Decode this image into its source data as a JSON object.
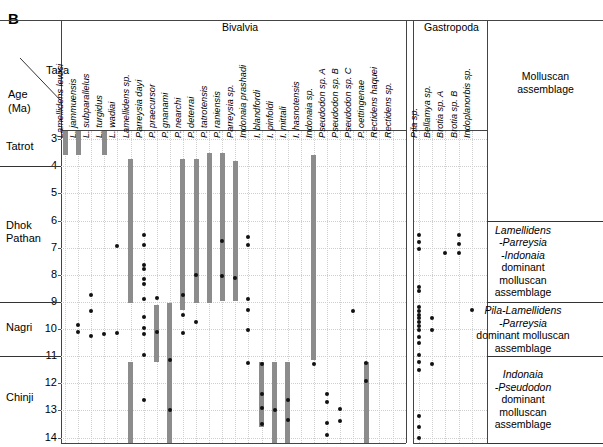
{
  "figure": {
    "panel_letter": "B",
    "axis_labels": {
      "taxa": "Taxa",
      "age_line1": "Age",
      "age_line2": "(Ma)"
    },
    "groups": [
      {
        "name": "bivalvia",
        "label": "Bivalvia"
      },
      {
        "name": "gastropoda",
        "label": "Gastropoda"
      },
      {
        "name": "assemblage",
        "label_line1": "Molluscan",
        "label_line2": "assemblage"
      }
    ],
    "formations": [
      {
        "name": "Tatrot",
        "top_age": 2.7,
        "bottom_age": 4.0
      },
      {
        "name": "Dhok Pathan",
        "top_age": 4.0,
        "bottom_age": 9.0
      },
      {
        "name": "Nagri",
        "top_age": 9.0,
        "bottom_age": 11.0
      },
      {
        "name": "Chinji",
        "top_age": 11.0,
        "bottom_age": 14.2
      }
    ],
    "age_ticks": [
      3,
      4,
      5,
      6,
      7,
      8,
      9,
      10,
      11,
      12,
      13,
      14
    ],
    "assemblages": [
      {
        "name": "lamellidens-parreysia-indonaia",
        "lines": [
          "Lamellidens",
          "-Parreysia",
          "-Indonaia",
          "dominant",
          "molluscan",
          "assemblage"
        ],
        "italic_lines": [
          0,
          1,
          2
        ],
        "top_age": 6.0,
        "bottom_age": 9.0
      },
      {
        "name": "pila-lamellidens-parreysia",
        "lines": [
          "Pila-Lamellidens",
          "-Parreysia",
          "dominant molluscan",
          "assemblage"
        ],
        "italic_lines": [
          0,
          1
        ],
        "top_age": 9.0,
        "bottom_age": 11.0
      },
      {
        "name": "indonaia-pseudodon",
        "lines": [
          "Indonaia",
          "-Pseudodon",
          "dominant",
          "molluscan",
          "assemblage"
        ],
        "italic_lines": [
          0,
          1
        ],
        "top_age": 11.0,
        "bottom_age": 14.2
      }
    ],
    "colors": {
      "range_bar": "#8c8c8c",
      "occurrence_dot": "#111111",
      "grid": "#cfcfcf",
      "frame": "#444444"
    }
  },
  "chart_data": {
    "type": "range-chart",
    "ylabel": "Age (Ma)",
    "ylim": [
      2.7,
      14.2
    ],
    "y_inverted": true,
    "grid": true,
    "bivalvia_taxa": [
      {
        "index": 0,
        "label": "Lamellidens lewisi",
        "bars": [
          [
            2.7,
            3.6
          ]
        ],
        "dots": []
      },
      {
        "index": 1,
        "label": "L. jammuensis",
        "bars": [
          [
            2.7,
            3.6
          ]
        ],
        "dots": [
          9.85,
          10.1
        ]
      },
      {
        "index": 2,
        "label": "L. subparallelus",
        "bars": [],
        "dots": [
          8.75,
          9.35,
          10.25
        ]
      },
      {
        "index": 3,
        "label": "L. turgidus",
        "bars": [
          [
            2.7,
            3.6
          ]
        ],
        "dots": [
          10.2
        ]
      },
      {
        "index": 4,
        "label": "L. wadiai",
        "bars": [],
        "dots": [
          6.95,
          10.15
        ]
      },
      {
        "index": 5,
        "label": "Lamellidens sp.",
        "bars": [
          [
            3.75,
            9.05
          ],
          [
            11.2,
            14.2
          ]
        ],
        "dots": []
      },
      {
        "index": 6,
        "label": "Parreysia dayi",
        "bars": [],
        "dots": [
          6.55,
          6.9,
          7.65,
          7.8,
          8.15,
          8.35,
          8.9,
          9.55,
          9.95,
          10.2,
          10.95,
          12.6
        ]
      },
      {
        "index": 7,
        "label": "P. praecursor",
        "bars": [
          [
            9.1,
            11.2
          ]
        ],
        "dots": [
          8.85,
          10.1
        ]
      },
      {
        "index": 8,
        "label": "P. gnanami",
        "bars": [
          [
            9.05,
            14.2
          ]
        ],
        "dots": [
          11.15,
          13.0
        ]
      },
      {
        "index": 9,
        "label": "P. nearchi",
        "bars": [
          [
            3.75,
            9.3
          ]
        ],
        "dots": [
          8.75,
          9.5,
          10.15
        ]
      },
      {
        "index": 10,
        "label": "P. deterrai",
        "bars": [
          [
            3.75,
            9.05
          ]
        ],
        "dots": [
          8.0,
          9.75
        ]
      },
      {
        "index": 11,
        "label": "P. tatrotensis",
        "bars": [
          [
            3.5,
            9.05
          ]
        ],
        "dots": []
      },
      {
        "index": 12,
        "label": "P. raniensis",
        "bars": [
          [
            3.5,
            8.95
          ]
        ],
        "dots": [
          6.75,
          8.05
        ]
      },
      {
        "index": 13,
        "label": "Parreysia sp.",
        "bars": [
          [
            3.8,
            8.95
          ]
        ],
        "dots": [
          8.1
        ]
      },
      {
        "index": 14,
        "label": "Indonaia prashadi",
        "bars": [],
        "dots": [
          6.6,
          6.9,
          8.9,
          9.3,
          10.05,
          11.25
        ]
      },
      {
        "index": 15,
        "label": "I. blandfordi",
        "bars": [
          [
            11.2,
            13.6
          ]
        ],
        "dots": [
          11.3,
          12.4,
          12.9,
          13.5
        ]
      },
      {
        "index": 16,
        "label": "I. pinfoldi",
        "bars": [
          [
            11.2,
            14.2
          ]
        ],
        "dots": [
          13.0
        ]
      },
      {
        "index": 17,
        "label": "I. mittali",
        "bars": [
          [
            11.2,
            14.2
          ]
        ],
        "dots": [
          12.6,
          13.35
        ]
      },
      {
        "index": 18,
        "label": "I. hasnotensis",
        "bars": [],
        "dots": []
      },
      {
        "index": 19,
        "label": "Indonaia sp.",
        "bars": [
          [
            3.6,
            11.15
          ]
        ],
        "dots": [
          11.3
        ]
      },
      {
        "index": 20,
        "label": "Pseudodon sp. A",
        "bars": [],
        "dots": [
          12.4,
          12.7,
          13.45,
          13.9
        ]
      },
      {
        "index": 21,
        "label": "Pseudodon sp. B",
        "bars": [],
        "dots": [
          12.95,
          13.4
        ]
      },
      {
        "index": 22,
        "label": "Pseudodon sp. C",
        "bars": [],
        "dots": [
          9.35
        ]
      },
      {
        "index": 23,
        "label": "P. oettingenae",
        "bars": [
          [
            11.2,
            14.2
          ]
        ],
        "dots": [
          11.25,
          11.9
        ]
      },
      {
        "index": 24,
        "label": "Rectidens haquei",
        "bars": [],
        "dots": []
      },
      {
        "index": 25,
        "label": "Rectidens sp.",
        "bars": [],
        "dots": []
      }
    ],
    "gastropoda_taxa": [
      {
        "index": 0,
        "label": "Pila sp.",
        "bars": [],
        "dots": [
          6.55,
          6.8,
          7.05,
          8.45,
          8.6,
          9.2,
          9.35,
          9.5,
          9.6,
          9.75,
          9.9,
          10.05,
          10.3,
          10.5,
          10.95,
          11.2,
          11.5,
          13.2,
          13.6,
          14.0
        ]
      },
      {
        "index": 1,
        "label": "Bellamya sp.",
        "bars": [],
        "dots": [
          9.6,
          10.05,
          11.3
        ]
      },
      {
        "index": 2,
        "label": "Brotia sp. A",
        "bars": [],
        "dots": [
          7.2
        ]
      },
      {
        "index": 3,
        "label": "Brotia sp. B",
        "bars": [],
        "dots": [
          6.55,
          6.85,
          7.2
        ]
      },
      {
        "index": 4,
        "label": "Indoplanorbis sp.",
        "bars": [],
        "dots": [
          9.3
        ]
      }
    ]
  }
}
